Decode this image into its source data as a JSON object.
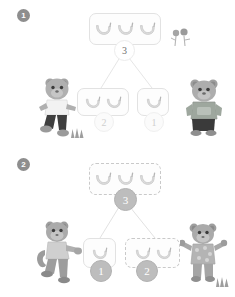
{
  "page": {
    "background": "#ffffff"
  },
  "colors": {
    "banana_fill": "#dcdcdc",
    "banana_stroke": "#b6b6b6",
    "box_border_solid": "#e2e2e2",
    "box_border_dashed": "#c9c9c9",
    "circle_filled": "#bdbdbd",
    "connector": "#e4e4e4",
    "badge": "#8e8e8e",
    "character_body": "#a8a8a8",
    "character_dark": "#4a4a4a"
  },
  "sections": [
    {
      "badge": "1",
      "badge_name": "section-badge-1",
      "whole": {
        "count": 3,
        "label": "3",
        "box_style": "solid",
        "circle_style": "light"
      },
      "parts": [
        {
          "count": 2,
          "label": "2",
          "box_style": "solid",
          "circle_style": "ghost"
        },
        {
          "count": 1,
          "label": "1",
          "box_style": "solid",
          "circle_style": "ghost"
        }
      ],
      "left_character": "bear-running-icon",
      "right_character": "bear-standing-icon",
      "decorations": [
        "flower-icon",
        "grass-icon"
      ]
    },
    {
      "badge": "2",
      "badge_name": "section-badge-2",
      "whole": {
        "count": 3,
        "label": "3",
        "box_style": "dashed",
        "circle_style": "filled"
      },
      "parts": [
        {
          "count": 1,
          "label": "1",
          "box_style": "solid",
          "circle_style": "filled"
        },
        {
          "count": 2,
          "label": "2",
          "box_style": "dashed",
          "circle_style": "filled"
        }
      ],
      "left_character": "monkey-running-icon",
      "right_character": "monkey-cheering-icon",
      "decorations": [
        "grass-icon"
      ]
    }
  ]
}
